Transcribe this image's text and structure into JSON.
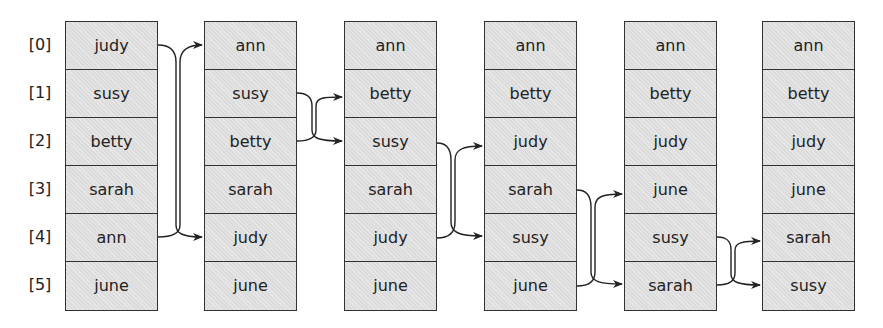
{
  "diagram": {
    "type": "selection-sort-passes",
    "indices": [
      "[0]",
      "[1]",
      "[2]",
      "[3]",
      "[4]",
      "[5]"
    ],
    "columns": [
      {
        "values": [
          "judy",
          "susy",
          "betty",
          "sarah",
          "ann",
          "june"
        ]
      },
      {
        "values": [
          "ann",
          "susy",
          "betty",
          "sarah",
          "judy",
          "june"
        ]
      },
      {
        "values": [
          "ann",
          "betty",
          "susy",
          "sarah",
          "judy",
          "june"
        ]
      },
      {
        "values": [
          "ann",
          "betty",
          "judy",
          "sarah",
          "susy",
          "june"
        ]
      },
      {
        "values": [
          "ann",
          "betty",
          "judy",
          "june",
          "susy",
          "sarah"
        ]
      },
      {
        "values": [
          "ann",
          "betty",
          "judy",
          "june",
          "sarah",
          "susy"
        ]
      }
    ],
    "swaps": [
      {
        "from_column": 0,
        "rows": [
          0,
          4
        ]
      },
      {
        "from_column": 1,
        "rows": [
          1,
          2
        ]
      },
      {
        "from_column": 2,
        "rows": [
          2,
          4
        ]
      },
      {
        "from_column": 3,
        "rows": [
          3,
          5
        ]
      },
      {
        "from_column": 4,
        "rows": [
          4,
          5
        ]
      }
    ],
    "colors": {
      "cell_fill": "#dcdcdc",
      "border": "#333333",
      "arrow": "#222222"
    }
  }
}
